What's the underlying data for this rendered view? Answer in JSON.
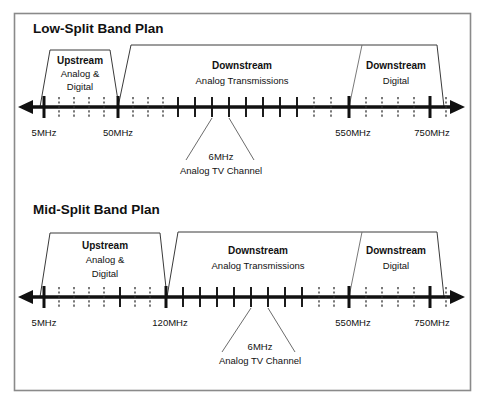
{
  "figure": {
    "border_color": "#8a8a8a",
    "ink": "#111111",
    "thin_line": "#555555"
  },
  "panels": [
    {
      "id": "low-split",
      "title": "Low-Split Band Plan",
      "upstream": {
        "heading": "Upstream",
        "line1": "Analog &",
        "line2": "Digital"
      },
      "downstream_analog": {
        "heading": "Downstream",
        "line1": "Analog Transmissions"
      },
      "downstream_digital": {
        "heading": "Downstream",
        "line1": "Digital"
      },
      "callout": {
        "line1": "6MHz",
        "line2": "Analog TV Channel"
      },
      "axis_labels": [
        {
          "text": "5MHz",
          "x": 44
        },
        {
          "text": "50MHz",
          "x": 115
        },
        {
          "text": "550MHz",
          "x": 353
        },
        {
          "text": "750MHz",
          "x": 432
        }
      ]
    },
    {
      "id": "mid-split",
      "title": "Mid-Split Band Plan",
      "upstream": {
        "heading": "Upstream",
        "line1": "Analog &",
        "line2": "Digital"
      },
      "downstream_analog": {
        "heading": "Downstream",
        "line1": "Analog Transmissions"
      },
      "downstream_digital": {
        "heading": "Downstream",
        "line1": "Digital"
      },
      "callout": {
        "line1": "6MHz",
        "line2": "Analog TV Channel"
      },
      "axis_labels": [
        {
          "text": "5MHz",
          "x": 44
        },
        {
          "text": "120MHz",
          "x": 165
        },
        {
          "text": "550MHz",
          "x": 353
        },
        {
          "text": "750MHz",
          "x": 432
        }
      ]
    }
  ]
}
